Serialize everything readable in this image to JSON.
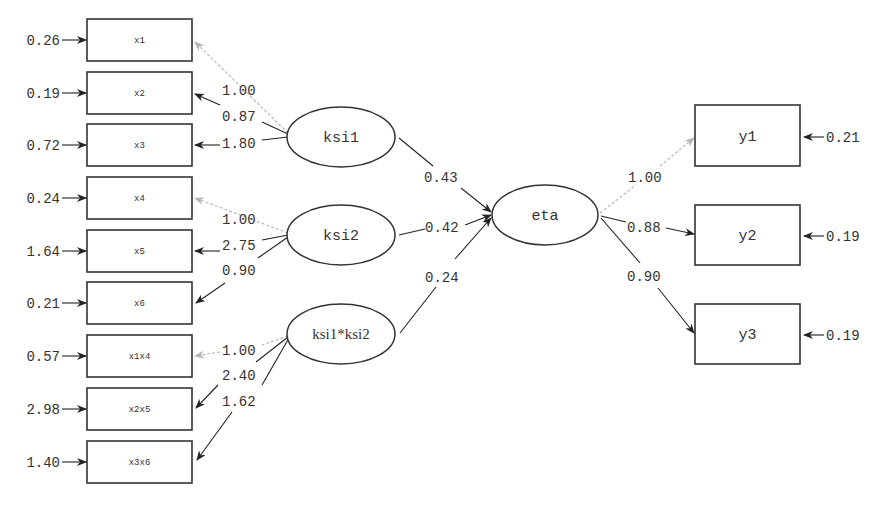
{
  "diagram": {
    "type": "structural-equation-path-diagram",
    "latent_exogenous": [
      {
        "id": "ksi1",
        "label": "ksi1"
      },
      {
        "id": "ksi2",
        "label": "ksi2"
      },
      {
        "id": "ksi12",
        "label": "ksi1*ksi2"
      }
    ],
    "latent_endogenous": [
      {
        "id": "eta",
        "label": "eta"
      }
    ],
    "x_indicators": [
      {
        "label": "x1",
        "error": "0.26",
        "loading": "1.00",
        "fixed": true
      },
      {
        "label": "x2",
        "error": "0.19",
        "loading": "0.87",
        "fixed": false
      },
      {
        "label": "x3",
        "error": "0.72",
        "loading": "1.80",
        "fixed": false
      },
      {
        "label": "x4",
        "error": "0.24",
        "loading": "1.00",
        "fixed": true
      },
      {
        "label": "x5",
        "error": "1.64",
        "loading": "2.75",
        "fixed": false
      },
      {
        "label": "x6",
        "error": "0.21",
        "loading": "0.90",
        "fixed": false
      },
      {
        "label": "x1x4",
        "error": "0.57",
        "loading": "1.00",
        "fixed": true
      },
      {
        "label": "x2x5",
        "error": "2.98",
        "loading": "2.40",
        "fixed": false
      },
      {
        "label": "x3x6",
        "error": "1.40",
        "loading": "1.62",
        "fixed": false
      }
    ],
    "y_indicators": [
      {
        "label": "y1",
        "error": "0.21",
        "loading": "1.00",
        "fixed": true
      },
      {
        "label": "y2",
        "error": "0.19",
        "loading": "0.88",
        "fixed": false
      },
      {
        "label": "y3",
        "error": "0.19",
        "loading": "0.90",
        "fixed": false
      }
    ],
    "structural_paths": [
      {
        "from": "ksi1",
        "to": "eta",
        "coef": "0.43"
      },
      {
        "from": "ksi2",
        "to": "eta",
        "coef": "0.42"
      },
      {
        "from": "ksi1*ksi2",
        "to": "eta",
        "coef": "0.24"
      }
    ],
    "colors": {
      "line": "#222222",
      "fixed_path": "#b5b5b5",
      "text": "#333333",
      "background": "#ffffff"
    }
  }
}
